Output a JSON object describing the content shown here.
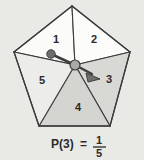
{
  "figure": {
    "background_color": "#e9e9e6",
    "outline_color": "#3b3b3b"
  },
  "spinner": {
    "shape": "pentagon",
    "sector_count": 5,
    "sectors": [
      {
        "label": "1",
        "fill": "#fbfbfa"
      },
      {
        "label": "2",
        "fill": "#fcfcfb"
      },
      {
        "label": "3",
        "fill": "#d8d8d4"
      },
      {
        "label": "4",
        "fill": "#d4d4d0"
      },
      {
        "label": "5",
        "fill": "#ececea"
      }
    ],
    "pointer": {
      "points_to": "3",
      "arrow_color": "#4a4a4a",
      "hub_color": "#9a9a96",
      "knob_color": "#6e6e6e"
    }
  },
  "caption": {
    "probability_label": "P(3)",
    "equals": "=",
    "numerator": "1",
    "denominator": "5"
  }
}
